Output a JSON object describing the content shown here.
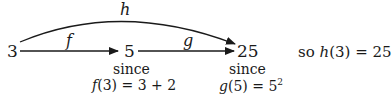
{
  "diagram": {
    "nodes": [
      {
        "id": "start",
        "label": "3"
      },
      {
        "id": "mid",
        "label": "5"
      },
      {
        "id": "end",
        "label": "25"
      }
    ],
    "edges": [
      {
        "from": "start",
        "to": "mid",
        "label": "f"
      },
      {
        "from": "mid",
        "to": "end",
        "label": "g"
      },
      {
        "from": "start",
        "to": "end",
        "label": "h",
        "curved": true
      }
    ],
    "annotations": {
      "mid_since": "since",
      "mid_eq_fn": "f",
      "mid_eq_rest": "(3) = 3 + 2",
      "end_since": "since",
      "end_eq_fn": "g",
      "end_eq_rest": "(5) = 5",
      "end_eq_exp": "2",
      "conclusion_prefix": "so ",
      "conclusion_fn": "h",
      "conclusion_rest": "(3) = 25"
    },
    "stroke_color": "#1a1a1a"
  }
}
